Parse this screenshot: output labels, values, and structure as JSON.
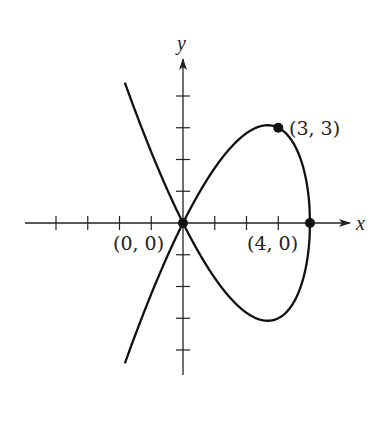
{
  "chart_data": {
    "type": "line",
    "title": "",
    "xlabel": "x",
    "ylabel": "y",
    "equation_implied": "y^2 = x^2 (4 - x)",
    "xlim": [
      -5,
      5
    ],
    "ylim": [
      -5,
      5
    ],
    "grid": false,
    "x_ticks": [
      -4,
      -3,
      -2,
      -1,
      1,
      2,
      3,
      4
    ],
    "y_ticks": [
      -4,
      -3,
      -2,
      -1,
      1,
      2,
      3,
      4
    ],
    "series": [
      {
        "name": "curve",
        "x": [
          -1.83,
          -1.5,
          -1,
          -0.5,
          0,
          0.5,
          1,
          1.5,
          2,
          2.5,
          2.67,
          3,
          3.5,
          3.8,
          4
        ],
        "y_upper": [
          4.42,
          3.52,
          2.24,
          1.06,
          0,
          0.94,
          1.73,
          2.37,
          2.83,
          3.06,
          3.08,
          3.0,
          2.47,
          1.7,
          0
        ],
        "y_lower": [
          -4.42,
          -3.52,
          -2.24,
          -1.06,
          0,
          -0.94,
          -1.73,
          -2.37,
          -2.83,
          -3.06,
          -3.08,
          -3.0,
          -2.47,
          -1.7,
          0
        ]
      }
    ],
    "points": [
      {
        "x": 0,
        "y": 0,
        "label": "(0, 0)"
      },
      {
        "x": 3,
        "y": 3,
        "label": "(3, 3)"
      },
      {
        "x": 4,
        "y": 0,
        "label": "(4, 0)"
      }
    ]
  },
  "axes": {
    "x_label": "x",
    "y_label": "y"
  }
}
